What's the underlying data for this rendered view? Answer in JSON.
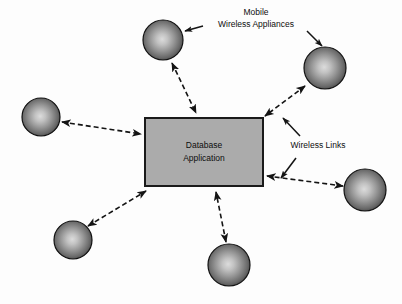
{
  "diagram": {
    "background_color": "#fdfdfd",
    "central_node": {
      "id": "database-application",
      "label_line_1": "Database",
      "label_line_2": "Application",
      "shape": "rectangle",
      "fill_color": "#ababab",
      "border_color": "#1a1a1a",
      "x": 145,
      "y": 118,
      "width": 118,
      "height": 68
    },
    "appliance_nodes": [
      {
        "id": "appliance-top",
        "name": "mobile-wireless-appliance",
        "cx": 163,
        "cy": 40,
        "r": 20
      },
      {
        "id": "appliance-top-right",
        "name": "mobile-wireless-appliance",
        "cx": 325,
        "cy": 68,
        "r": 21
      },
      {
        "id": "appliance-left",
        "name": "mobile-wireless-appliance",
        "cx": 41,
        "cy": 117,
        "r": 19
      },
      {
        "id": "appliance-right",
        "name": "mobile-wireless-appliance",
        "cx": 365,
        "cy": 190,
        "r": 21
      },
      {
        "id": "appliance-bottom-left",
        "name": "mobile-wireless-appliance",
        "cx": 73,
        "cy": 240,
        "r": 19
      },
      {
        "id": "appliance-bottom-mid",
        "name": "mobile-wireless-appliance",
        "cx": 229,
        "cy": 265,
        "r": 21
      }
    ],
    "sphere_style": {
      "highlight_color": "#d8d8d8",
      "mid_color": "#8a8a8a",
      "edge_color": "#2a2a2a",
      "outline_color": "#111111"
    },
    "links": [
      {
        "id": "link-top",
        "name": "wireless-link",
        "x1": 172,
        "y1": 63,
        "x2": 196,
        "y2": 113,
        "style": "dashed",
        "arrows": "both"
      },
      {
        "id": "link-top-right",
        "name": "wireless-link",
        "x1": 305,
        "y1": 86,
        "x2": 265,
        "y2": 116,
        "style": "dashed",
        "arrows": "both"
      },
      {
        "id": "link-left",
        "name": "wireless-link",
        "x1": 62,
        "y1": 122,
        "x2": 141,
        "y2": 134,
        "style": "dashed",
        "arrows": "both"
      },
      {
        "id": "link-right",
        "name": "wireless-link",
        "x1": 343,
        "y1": 186,
        "x2": 267,
        "y2": 176,
        "style": "dashed",
        "arrows": "both"
      },
      {
        "id": "link-bottom-left",
        "name": "wireless-link",
        "x1": 88,
        "y1": 226,
        "x2": 146,
        "y2": 191,
        "style": "dashed",
        "arrows": "both"
      },
      {
        "id": "link-bottom-mid",
        "name": "wireless-link",
        "x1": 226,
        "y1": 242,
        "x2": 216,
        "y2": 192,
        "style": "dashed",
        "arrows": "both"
      }
    ],
    "link_style": {
      "color": "#141414",
      "width": 1.6,
      "dash_pattern": "5,3"
    },
    "annotations": [
      {
        "id": "annotation-appliances",
        "name": "mobile-wireless-appliances-label",
        "line_1": "Mobile",
        "line_2": "Wireless Appliances",
        "text_x": 256,
        "text_y_1": 13,
        "text_y_2": 25,
        "leaders": [
          {
            "id": "leader-appliances-left",
            "x1": 203,
            "y1": 26,
            "x2": 185,
            "y2": 31
          },
          {
            "id": "leader-appliances-right",
            "x1": 307,
            "y1": 31,
            "x2": 322,
            "y2": 46
          }
        ]
      },
      {
        "id": "annotation-wireless-links",
        "name": "wireless-links-label",
        "line_1": "Wireless Links",
        "line_2": "",
        "text_x": 318,
        "text_y_1": 146,
        "text_y_2": null,
        "leaders": [
          {
            "id": "leader-links-up",
            "x1": 300,
            "y1": 136,
            "x2": 283,
            "y2": 118
          },
          {
            "id": "leader-links-down",
            "x1": 296,
            "y1": 158,
            "x2": 281,
            "y2": 178
          }
        ]
      }
    ]
  }
}
